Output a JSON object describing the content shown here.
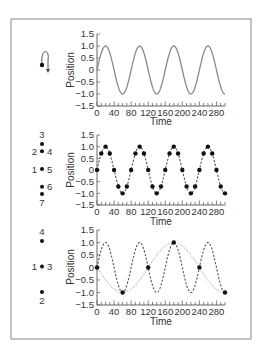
{
  "chart_data": [
    {
      "type": "line",
      "title": "",
      "xlabel": "Time",
      "ylabel": "Position",
      "xlim": [
        0,
        300
      ],
      "ylim": [
        -1.5,
        1.5
      ],
      "x_ticks": [
        0,
        40,
        80,
        120,
        160,
        200,
        240,
        280
      ],
      "x_minor_step": 10,
      "y_ticks": [
        "1.5",
        "1.0",
        "0.5",
        "0",
        "−0.5",
        "−1.0",
        "−1.5"
      ],
      "grid": false,
      "series": [
        {
          "name": "true motion",
          "function": "sin(2*pi*t/80)",
          "style": "solid",
          "color": "#8a8a8a"
        }
      ],
      "inset": {
        "type": "rotation-icon",
        "description": "dot on circular arc with downward arrow"
      }
    },
    {
      "type": "line",
      "title": "",
      "xlabel": "Time",
      "ylabel": "Position",
      "xlim": [
        0,
        300
      ],
      "ylim": [
        -1.5,
        1.5
      ],
      "x_ticks": [
        0,
        40,
        80,
        120,
        160,
        200,
        240,
        280
      ],
      "x_minor_step": 10,
      "y_ticks": [
        "1.5",
        "1.0",
        "0.5",
        "0",
        "−0.5",
        "−1.0",
        "−1.5"
      ],
      "grid": false,
      "series": [
        {
          "name": "true motion",
          "function": "sin(2*pi*t/80)",
          "style": "dashed",
          "color": "#555555"
        },
        {
          "name": "samples",
          "style": "points",
          "color": "#111111",
          "x": [
            0,
            10,
            20,
            30,
            40,
            50,
            60,
            70,
            80,
            90,
            100,
            110,
            120,
            130,
            140,
            150,
            160,
            170,
            180,
            190,
            200,
            210,
            220,
            230,
            240,
            250,
            260,
            270,
            280,
            290,
            300
          ],
          "y": [
            0,
            0.71,
            1,
            0.71,
            0,
            -0.71,
            -1,
            -0.71,
            0,
            0.71,
            1,
            0.71,
            0,
            -0.71,
            -1,
            -0.71,
            0,
            0.71,
            1,
            0.71,
            0,
            -0.71,
            -1,
            -0.71,
            0,
            0.71,
            1,
            0.71,
            0,
            -0.71,
            -1
          ]
        }
      ],
      "position_diagram": {
        "points": [
          {
            "y": 1.0,
            "labels": [
              "3"
            ]
          },
          {
            "y": 0.71,
            "labels": [
              "2",
              "4"
            ]
          },
          {
            "y": 0.0,
            "labels": [
              "1",
              "5"
            ]
          },
          {
            "y": -0.71,
            "labels": [
              "6"
            ]
          },
          {
            "y": -1.0,
            "labels": [
              "7"
            ]
          }
        ]
      }
    },
    {
      "type": "line",
      "title": "",
      "xlabel": "Time",
      "ylabel": "Position",
      "xlim": [
        0,
        300
      ],
      "ylim": [
        -1.5,
        1.5
      ],
      "x_ticks": [
        0,
        40,
        80,
        120,
        160,
        200,
        240,
        280
      ],
      "x_minor_step": 10,
      "y_ticks": [
        "1.5",
        "1.0",
        "0.5",
        "0",
        "−0.5",
        "−1.0",
        "−1.5"
      ],
      "grid": false,
      "series": [
        {
          "name": "true motion",
          "function": "sin(2*pi*t/80)",
          "style": "dashed",
          "color": "#555555"
        },
        {
          "name": "apparent (aliased) motion",
          "function": "-sin(2*pi*t/240)",
          "style": "dotted",
          "color": "#b0b0b0"
        },
        {
          "name": "samples",
          "style": "points",
          "color": "#111111",
          "x": [
            0,
            60,
            120,
            180,
            240,
            300
          ],
          "y": [
            0,
            -1,
            0,
            1,
            0,
            -1
          ]
        }
      ],
      "position_diagram": {
        "points": [
          {
            "y": 1.0,
            "labels": [
              "4"
            ]
          },
          {
            "y": 0.0,
            "labels": [
              "1",
              "3"
            ]
          },
          {
            "y": -1.0,
            "labels": [
              "2"
            ]
          }
        ]
      }
    }
  ],
  "panels": [
    {
      "xlabel": "Time",
      "ylabel": "Position"
    },
    {
      "xlabel": "Time",
      "ylabel": "Position"
    },
    {
      "xlabel": "Time",
      "ylabel": "Position"
    }
  ]
}
